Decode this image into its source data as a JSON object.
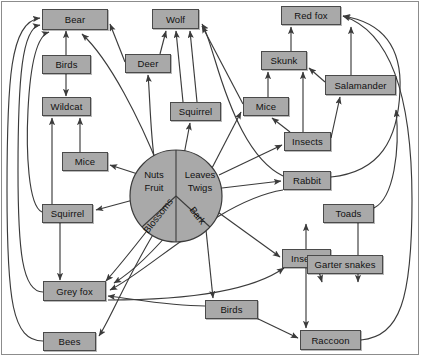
{
  "diagram": {
    "type": "food-web",
    "colors": {
      "node_fill": "#a9a9a9",
      "node_stroke": "#4a4a4a",
      "edge": "#3b3b3b",
      "background": "#ffffff",
      "frame": "#8c8c8c"
    },
    "producer_hub": {
      "name": "plant-resources-pie",
      "slices": [
        {
          "id": "nuts-fruit",
          "lines": [
            "Nuts",
            "Fruit"
          ]
        },
        {
          "id": "leaves-twigs",
          "lines": [
            "Leaves",
            "Twigs"
          ]
        },
        {
          "id": "blossoms",
          "lines": [
            "Blossoms"
          ]
        },
        {
          "id": "bark",
          "lines": [
            "Bark"
          ]
        }
      ]
    },
    "nodes": [
      {
        "id": "bear",
        "label": "Bear",
        "x": 42,
        "y": 9,
        "w": 66,
        "h": 21
      },
      {
        "id": "birds-top",
        "label": "Birds",
        "x": 42,
        "y": 55,
        "w": 49,
        "h": 19
      },
      {
        "id": "wildcat",
        "label": "Wildcat",
        "x": 42,
        "y": 97,
        "w": 49,
        "h": 19
      },
      {
        "id": "mice-left",
        "label": "Mice",
        "x": 62,
        "y": 152,
        "w": 46,
        "h": 19
      },
      {
        "id": "squirrel-left",
        "label": "Squirrel",
        "x": 42,
        "y": 204,
        "w": 51,
        "h": 19
      },
      {
        "id": "grey-fox",
        "label": "Grey fox",
        "x": 43,
        "y": 281,
        "w": 63,
        "h": 20
      },
      {
        "id": "bees",
        "label": "Bees",
        "x": 43,
        "y": 332,
        "w": 53,
        "h": 19
      },
      {
        "id": "wolf",
        "label": "Wolf",
        "x": 152,
        "y": 9,
        "w": 47,
        "h": 20
      },
      {
        "id": "deer",
        "label": "Deer",
        "x": 125,
        "y": 54,
        "w": 46,
        "h": 19
      },
      {
        "id": "squirrel-mid",
        "label": "Squirrel",
        "x": 170,
        "y": 102,
        "w": 51,
        "h": 19
      },
      {
        "id": "red-fox",
        "label": "Red fox",
        "x": 281,
        "y": 6,
        "w": 60,
        "h": 19
      },
      {
        "id": "skunk",
        "label": "Skunk",
        "x": 261,
        "y": 51,
        "w": 46,
        "h": 19
      },
      {
        "id": "salamander",
        "label": "Salamander",
        "x": 325,
        "y": 75,
        "w": 71,
        "h": 20
      },
      {
        "id": "mice-mid",
        "label": "Mice",
        "x": 243,
        "y": 97,
        "w": 46,
        "h": 19
      },
      {
        "id": "insects-top",
        "label": "Insects",
        "x": 284,
        "y": 132,
        "w": 47,
        "h": 19
      },
      {
        "id": "rabbit",
        "label": "Rabbit",
        "x": 283,
        "y": 171,
        "w": 48,
        "h": 19
      },
      {
        "id": "toads",
        "label": "Toads",
        "x": 323,
        "y": 204,
        "w": 51,
        "h": 19
      },
      {
        "id": "insects-bot",
        "label": "Insects",
        "x": 282,
        "y": 249,
        "w": 49,
        "h": 19
      },
      {
        "id": "garter-snakes",
        "label": "Garter snakes",
        "x": 307,
        "y": 255,
        "w": 76,
        "h": 19
      },
      {
        "id": "birds-bot",
        "label": "Birds",
        "x": 205,
        "y": 300,
        "w": 53,
        "h": 19
      },
      {
        "id": "raccoon",
        "label": "Raccoon",
        "x": 300,
        "y": 330,
        "w": 61,
        "h": 20
      }
    ],
    "edges": [
      {
        "from": "birds-top",
        "to": "bear"
      },
      {
        "from": "birds-top",
        "to": "wildcat"
      },
      {
        "from": "wildcat",
        "to": "bear"
      },
      {
        "from": "mice-left",
        "to": "wildcat"
      },
      {
        "from": "squirrel-left",
        "to": "wildcat"
      },
      {
        "from": "squirrel-left",
        "to": "grey-fox"
      },
      {
        "from": "bees",
        "to": "bear"
      },
      {
        "from": "deer",
        "to": "bear"
      },
      {
        "from": "deer",
        "to": "wolf"
      },
      {
        "from": "squirrel-mid",
        "to": "wolf"
      },
      {
        "from": "mice-mid",
        "to": "wolf"
      },
      {
        "from": "skunk",
        "to": "red-fox"
      },
      {
        "from": "salamander",
        "to": "red-fox"
      },
      {
        "from": "salamander",
        "to": "skunk"
      },
      {
        "from": "mice-mid",
        "to": "skunk"
      },
      {
        "from": "insects-top",
        "to": "skunk"
      },
      {
        "from": "insects-top",
        "to": "mice-mid"
      },
      {
        "from": "insects-top",
        "to": "salamander"
      },
      {
        "from": "rabbit",
        "to": "red-fox"
      },
      {
        "from": "rabbit",
        "to": "wolf"
      },
      {
        "from": "toads",
        "to": "garter-snakes"
      },
      {
        "from": "insects-bot",
        "to": "toads"
      },
      {
        "from": "insects-bot",
        "to": "garter-snakes"
      },
      {
        "from": "insects-bot",
        "to": "raccoon"
      },
      {
        "from": "birds-bot",
        "to": "raccoon"
      },
      {
        "from": "birds-bot",
        "to": "grey-fox"
      },
      {
        "from": "raccoon",
        "to": "red-fox"
      },
      {
        "from": "plant-hub",
        "to": "bear"
      },
      {
        "from": "plant-hub",
        "to": "deer"
      },
      {
        "from": "plant-hub",
        "to": "squirrel-mid"
      },
      {
        "from": "plant-hub",
        "to": "mice-left"
      },
      {
        "from": "plant-hub",
        "to": "mice-mid"
      },
      {
        "from": "plant-hub",
        "to": "squirrel-left"
      },
      {
        "from": "plant-hub",
        "to": "grey-fox"
      },
      {
        "from": "plant-hub",
        "to": "rabbit"
      },
      {
        "from": "plant-hub",
        "to": "insects-top"
      },
      {
        "from": "plant-hub",
        "to": "insects-bot"
      },
      {
        "from": "plant-hub",
        "to": "birds-bot"
      },
      {
        "from": "plant-hub",
        "to": "bees"
      }
    ]
  }
}
